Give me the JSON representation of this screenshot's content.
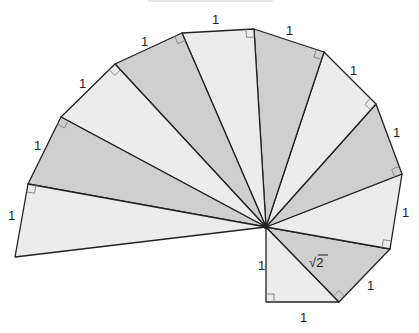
{
  "diagram": {
    "type": "spiral-of-theodorus",
    "center": [
      266,
      227
    ],
    "vertices": [
      [
        266,
        302
      ],
      [
        339,
        302
      ],
      [
        390,
        249
      ],
      [
        402,
        174
      ],
      [
        376,
        104
      ],
      [
        324,
        52
      ],
      [
        254,
        29
      ],
      [
        182,
        33
      ],
      [
        115,
        64
      ],
      [
        61,
        117
      ],
      [
        28,
        184
      ],
      [
        15,
        257
      ]
    ],
    "colors": {
      "light": "#ececec",
      "dark": "#cfcfcf",
      "stroke": "#222222",
      "right_angle": "#888888"
    },
    "labels": [
      {
        "text": "1",
        "x": 258,
        "y": 270,
        "name": "label-first-leg"
      },
      {
        "text": "1",
        "x": 300,
        "y": 322,
        "name": "label-base"
      },
      {
        "text": "1",
        "x": 367,
        "y": 290,
        "name": "label-edge-2"
      },
      {
        "text": "1",
        "x": 402,
        "y": 217,
        "name": "label-edge-3"
      },
      {
        "text": "1",
        "x": 393,
        "y": 137,
        "name": "label-edge-4"
      },
      {
        "text": "1",
        "x": 350,
        "y": 75,
        "name": "label-edge-5"
      },
      {
        "text": "1",
        "x": 286,
        "y": 35,
        "name": "label-edge-6"
      },
      {
        "text": "1",
        "x": 212,
        "y": 24,
        "name": "label-edge-7"
      },
      {
        "text": "1",
        "x": 141,
        "y": 46,
        "name": "label-edge-8"
      },
      {
        "text": "1",
        "x": 79,
        "y": 88,
        "name": "label-edge-9"
      },
      {
        "text": "1",
        "x": 34,
        "y": 150,
        "name": "label-edge-10"
      },
      {
        "text": "1",
        "x": 8,
        "y": 220,
        "name": "label-edge-11"
      }
    ],
    "sqrt_label": {
      "radical": "√",
      "value": "2",
      "x": 309,
      "y": 267
    }
  }
}
